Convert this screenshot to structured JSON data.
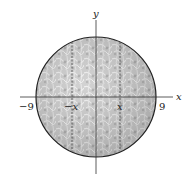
{
  "diagram": {
    "type": "circle-on-axes",
    "axes": {
      "x_label": "x",
      "y_label": "y"
    },
    "tick_labels": {
      "neg_radius": "−9",
      "pos_radius": "9",
      "neg_x": "−x",
      "pos_x": "x"
    },
    "radius": 9,
    "colors": {
      "fill": "#c8c8c8",
      "texture_dark": "#9a9a9a",
      "texture_light": "#e8e8e8",
      "outline": "#222222",
      "axis": "#333333"
    }
  }
}
